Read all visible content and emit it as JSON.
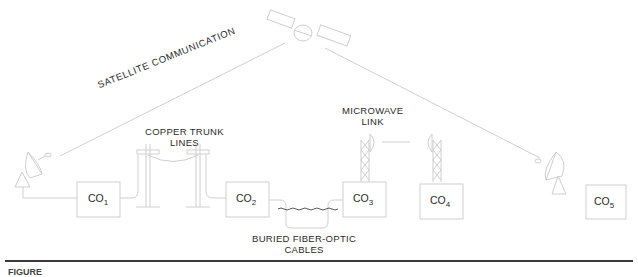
{
  "diagram": {
    "labels": {
      "satellite": "SATELLITE COMMUNICATION",
      "copper_line1": "COPPER TRUNK",
      "copper_line2": "LINES",
      "microwave_line1": "MICROWAVE",
      "microwave_line2": "LINK",
      "fiber_line1": "BURIED FIBER-OPTIC",
      "fiber_line2": "CABLES"
    },
    "offices": [
      {
        "base": "CO",
        "sub": "1"
      },
      {
        "base": "CO",
        "sub": "2"
      },
      {
        "base": "CO",
        "sub": "3"
      },
      {
        "base": "CO",
        "sub": "4"
      },
      {
        "base": "CO",
        "sub": "5"
      }
    ],
    "caption": "FIGURE"
  },
  "colors": {
    "line": "#cfcfcf",
    "text": "#2a2a2a",
    "rule": "#3a3a3a",
    "fiber": "#333333"
  }
}
